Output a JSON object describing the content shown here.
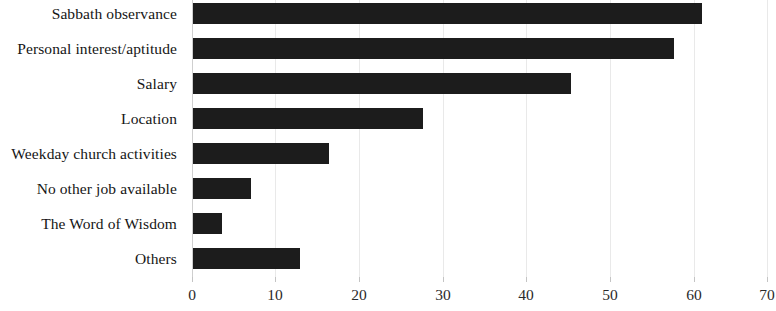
{
  "chart_data": {
    "type": "bar",
    "orientation": "horizontal",
    "title": "",
    "subtitle": "",
    "xlabel": "",
    "ylabel": "",
    "xlim": [
      0,
      70
    ],
    "xticks": [
      "0",
      "10",
      "20",
      "30",
      "40",
      "50",
      "60",
      "70"
    ],
    "grid": true,
    "legend": null,
    "legend_position": "none",
    "bar_color": "#1c1c1c",
    "gridline_color": "#e9e9e9",
    "axis_color": "#cfcfcf",
    "background_color": "#ffffff",
    "categories": [
      "Sabbath observance",
      "Personal interest/aptitude",
      "Salary",
      "Location",
      "Weekday church activities",
      "No other job available",
      "The Word of Wisdom",
      "Others"
    ],
    "values": [
      62,
      58.5,
      46,
      28,
      16.5,
      7,
      3.5,
      13
    ]
  }
}
